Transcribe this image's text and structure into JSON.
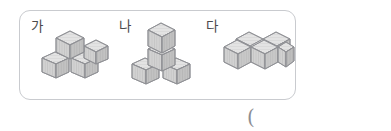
{
  "page": {
    "background_color": "#ffffff",
    "width": 391,
    "height": 131
  },
  "figure_box": {
    "border_color": "#c9cbcf",
    "corner_radius": 11
  },
  "palette": {
    "cube_top_fill": "#e3e3e3",
    "cube_left_fill": "#d2d2d2",
    "cube_right_fill": "#c2c2c2",
    "cube_stroke": "#8f9094",
    "hatch_stroke": "#b4b4b4",
    "label_color": "#4a4a4c",
    "paren_color": "#8c8e93"
  },
  "figures": [
    {
      "id": "ga",
      "label": "가",
      "cube_count": 4,
      "description": "three cubes on the bottom layer in an L arrangement with one cube stacked on the back corner"
    },
    {
      "id": "na",
      "label": "나",
      "cube_count": 4,
      "description": "a tower of two cubes at the back corner with two cubes flanking it on the bottom layer"
    },
    {
      "id": "da",
      "label": "다",
      "cube_count": 5,
      "description": "a flat slab one cube tall, four cubes in a two by two block with one extra cube at the right front"
    }
  ],
  "answer": {
    "paren_text": "("
  }
}
